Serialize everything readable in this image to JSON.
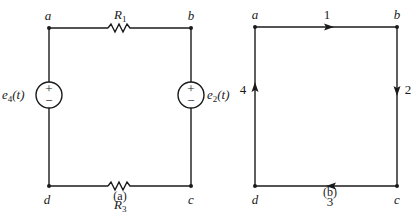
{
  "diagram_a": {
    "caption": "(a)",
    "nodes": [
      {
        "id": "a",
        "label": "a"
      },
      {
        "id": "b",
        "label": "b"
      },
      {
        "id": "c",
        "label": "c"
      },
      {
        "id": "d",
        "label": "d"
      }
    ],
    "resistors": [
      {
        "id": "R1",
        "symbol": "R",
        "subscript": "1",
        "between": [
          "a",
          "b"
        ]
      },
      {
        "id": "R3",
        "symbol": "R",
        "subscript": "3",
        "between": [
          "d",
          "c"
        ]
      }
    ],
    "sources": [
      {
        "id": "e4",
        "symbol": "e",
        "subscript": "4",
        "arg": "(t)",
        "between": [
          "a",
          "d"
        ],
        "plus": "+",
        "minus": "−"
      },
      {
        "id": "e2",
        "symbol": "e",
        "subscript": "2",
        "arg": "(t)",
        "between": [
          "b",
          "c"
        ],
        "plus": "+",
        "minus": "−"
      }
    ]
  },
  "diagram_b": {
    "caption": "(b)",
    "nodes": [
      {
        "id": "a",
        "label": "a"
      },
      {
        "id": "b",
        "label": "b"
      },
      {
        "id": "c",
        "label": "c"
      },
      {
        "id": "d",
        "label": "d"
      }
    ],
    "edges": [
      {
        "label": "1",
        "from": "a",
        "to": "b"
      },
      {
        "label": "2",
        "from": "b",
        "to": "c"
      },
      {
        "label": "3",
        "from": "c",
        "to": "d"
      },
      {
        "label": "4",
        "from": "d",
        "to": "a"
      }
    ]
  }
}
